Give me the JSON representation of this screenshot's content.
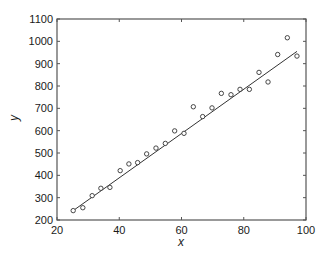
{
  "chart_data": {
    "type": "scatter",
    "title": "",
    "xlabel": "x",
    "ylabel": "y",
    "xlim": [
      20,
      100
    ],
    "ylim": [
      200,
      1100
    ],
    "xticks": [
      20,
      40,
      60,
      80,
      100
    ],
    "yticks": [
      200,
      300,
      400,
      500,
      600,
      700,
      800,
      900,
      1000,
      1100
    ],
    "grid": false,
    "legend": null,
    "series": [
      {
        "name": "data",
        "marker": "open-circle",
        "points": [
          [
            25.2,
            242
          ],
          [
            28.3,
            255
          ],
          [
            31.3,
            309
          ],
          [
            34.1,
            342
          ],
          [
            37.0,
            346
          ],
          [
            40.3,
            421
          ],
          [
            43.1,
            451
          ],
          [
            45.9,
            457
          ],
          [
            48.8,
            496
          ],
          [
            51.8,
            522
          ],
          [
            54.8,
            543
          ],
          [
            57.8,
            599
          ],
          [
            60.8,
            588
          ],
          [
            63.8,
            707
          ],
          [
            66.8,
            663
          ],
          [
            69.8,
            702
          ],
          [
            72.8,
            767
          ],
          [
            75.9,
            761
          ],
          [
            78.8,
            785
          ],
          [
            81.8,
            785
          ],
          [
            84.9,
            861
          ],
          [
            87.8,
            818
          ],
          [
            90.9,
            941
          ],
          [
            94.0,
            1016
          ],
          [
            97.1,
            934
          ]
        ]
      },
      {
        "name": "fit",
        "type": "line",
        "points": [
          [
            25.2,
            242
          ],
          [
            97.1,
            955
          ]
        ]
      }
    ]
  },
  "colors": {
    "axis": "#555555",
    "marker": "#333333",
    "line": "#333333"
  }
}
